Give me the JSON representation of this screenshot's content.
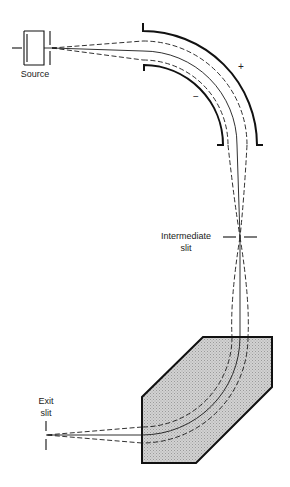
{
  "diagram": {
    "labels": {
      "source": "Source",
      "plus": "+",
      "minus": "−",
      "intermediate_line1": "Intermediate",
      "intermediate_line2": "slit",
      "exit_line1": "Exit",
      "exit_line2": "slit"
    },
    "components": [
      {
        "name": "ion-source",
        "label": "Source"
      },
      {
        "name": "electrostatic-analyzer",
        "polarity_outer": "+",
        "polarity_inner": "−"
      },
      {
        "name": "intermediate-slit",
        "label": "Intermediate slit"
      },
      {
        "name": "magnetic-sector",
        "fill": "#c9c9c9"
      },
      {
        "name": "exit-slit",
        "label": "Exit slit"
      }
    ],
    "colors": {
      "line": "#111111",
      "magnet_fill": "#c9c9c9",
      "background": "#ffffff"
    }
  }
}
